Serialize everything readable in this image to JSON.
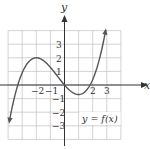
{
  "chart_data": {
    "type": "line",
    "title": "",
    "xlabel": "x",
    "ylabel": "y",
    "xlim": [
      -4,
      4
    ],
    "ylim": [
      -4,
      4
    ],
    "grid": true,
    "x_tick_labels": [
      "−2",
      "−1",
      "2",
      "3"
    ],
    "x_tick_values": [
      -2,
      -1,
      2,
      3
    ],
    "y_tick_labels": [
      "3",
      "2",
      "1",
      "−1",
      "−2",
      "−3"
    ],
    "y_tick_values": [
      3,
      2,
      1,
      -1,
      -2,
      -3
    ],
    "series": [
      {
        "name": "y = f(x)",
        "formula": "0.2*(x^3 + 1.5*x^2 - 6*x)",
        "x_range": [
          -3.9,
          2.92
        ],
        "arrows_at_ends": true,
        "key_points": [
          {
            "label": "left end (arrow)",
            "x": -3.9,
            "y": -2.6
          },
          {
            "label": "x-intercept",
            "x": -3.3,
            "y": 0
          },
          {
            "label": "local max",
            "x": -2,
            "y": 2
          },
          {
            "label": "origin",
            "x": 0,
            "y": 0
          },
          {
            "label": "local min",
            "x": 1,
            "y": -0.7
          },
          {
            "label": "x-intercept",
            "x": 1.8,
            "y": 0
          },
          {
            "label": "right end (arrow)",
            "x": 2.92,
            "y": 4
          }
        ]
      }
    ],
    "annotations": [
      {
        "text": "y = f(x)",
        "x": 2.2,
        "y": -2.5,
        "boxed": true
      }
    ],
    "legend_position": "none"
  },
  "labels": {
    "x_axis": "x",
    "y_axis": "y",
    "function": "y = f(x)",
    "xticks": [
      "−2",
      "−1",
      "2",
      "3"
    ],
    "yticks": [
      "3",
      "2",
      "1",
      "−1",
      "−2",
      "−3"
    ]
  },
  "colors": {
    "grid": "#c8c8c8",
    "axis": "#333333",
    "curve": "#555555",
    "background": "#ffffff"
  }
}
